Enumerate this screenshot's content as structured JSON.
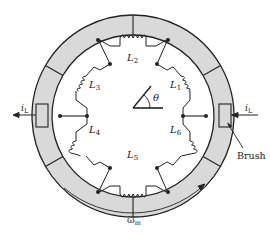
{
  "diagram": {
    "labels": {
      "coil_1": "L",
      "coil_1_sub": "1",
      "coil_2": "L",
      "coil_2_sub": "2",
      "coil_3": "L",
      "coil_3_sub": "3",
      "coil_4": "L",
      "coil_4_sub": "4",
      "coil_5": "L",
      "coil_5_sub": "5",
      "coil_6": "L",
      "coil_6_sub": "6",
      "angle": "θ",
      "current_left": "i",
      "current_left_sub": "L",
      "current_right": "i",
      "current_right_sub": "L",
      "brush": "Brush",
      "speed": "ω",
      "speed_sub": "m"
    },
    "colors": {
      "commutator_fill": "#d9d9d9",
      "line": "#222222",
      "background": "#ffffff"
    },
    "segments": 6,
    "coils": 6
  }
}
